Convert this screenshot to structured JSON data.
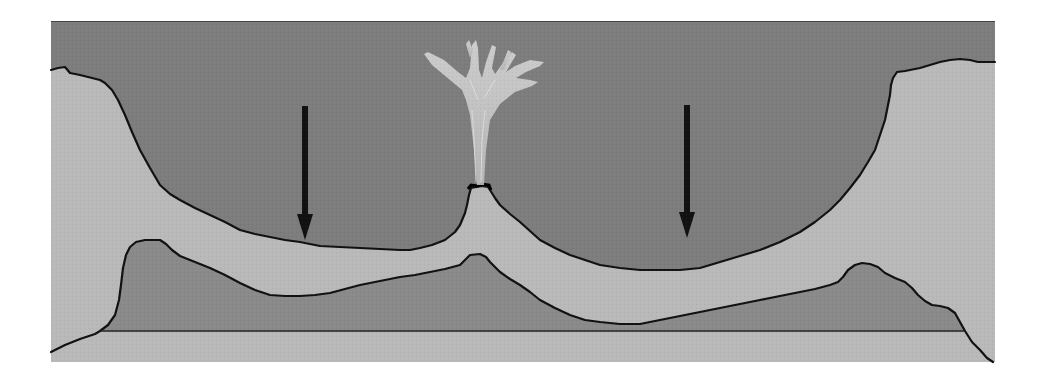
{
  "diagram": {
    "title": "",
    "colors": {
      "background": "#ffffff",
      "water": "#7d7d7d",
      "sediment_light": "#b9b9b9",
      "rock_dark": "#8a8a8a",
      "base_layer": "#a2a2a2",
      "outline": "#111111",
      "arrow": "#111111",
      "plume": "#c8c8c8"
    },
    "elements": [
      {
        "id": "water-column",
        "label": ""
      },
      {
        "id": "upper-crust-layer",
        "label": ""
      },
      {
        "id": "lower-rock-layer",
        "label": ""
      },
      {
        "id": "base-layer",
        "label": ""
      },
      {
        "id": "volcanic-vent",
        "label": ""
      },
      {
        "id": "eruption-plume",
        "label": ""
      },
      {
        "id": "subsidence-arrow-left",
        "label": "",
        "direction": "down"
      },
      {
        "id": "subsidence-arrow-right",
        "label": "",
        "direction": "down"
      }
    ]
  }
}
